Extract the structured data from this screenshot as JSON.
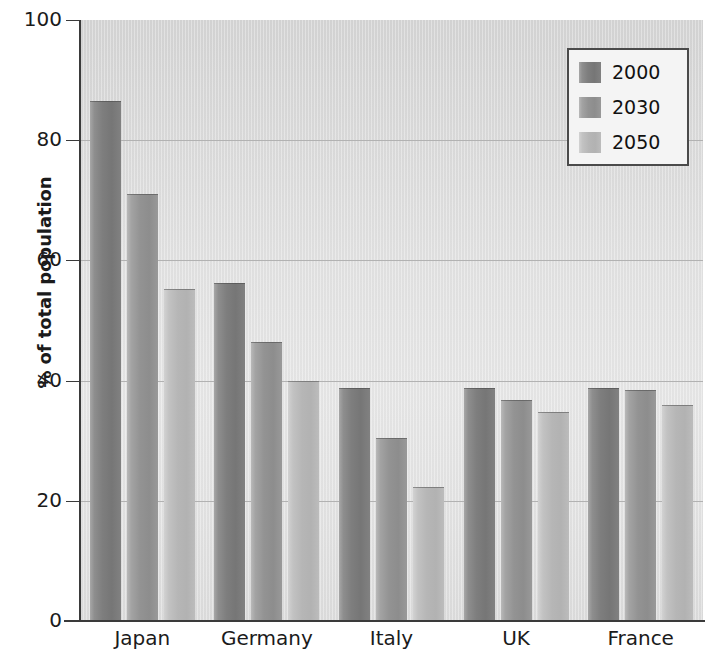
{
  "chart_data": {
    "type": "bar",
    "title": "",
    "xlabel": "",
    "ylabel": "% of total population",
    "ylim": [
      0,
      100
    ],
    "yticks": [
      0,
      20,
      40,
      60,
      80,
      100
    ],
    "grid": "horizontal",
    "legend_position": "top-right",
    "categories": [
      "Japan",
      "Germany",
      "Italy",
      "UK",
      "France"
    ],
    "series": [
      {
        "name": "2000",
        "color": "#7e7e7e",
        "values": [
          86.5,
          56.3,
          38.7,
          38.8,
          38.8
        ]
      },
      {
        "name": "2030",
        "color": "#939393",
        "values": [
          71.0,
          46.5,
          30.5,
          36.8,
          38.5
        ]
      },
      {
        "name": "2050",
        "color": "#b6b6b6",
        "values": [
          55.3,
          40.0,
          22.3,
          34.7,
          36.0
        ]
      }
    ]
  },
  "axis": {
    "y_title": "% of total population",
    "y_tick_labels": [
      "100",
      "80",
      "60",
      "40",
      "20",
      "0"
    ],
    "x_tick_labels": [
      "Japan",
      "Germany",
      "Italy",
      "UK",
      "France"
    ]
  },
  "legend": {
    "entries": [
      {
        "label": "2000"
      },
      {
        "label": "2030"
      },
      {
        "label": "2050"
      }
    ]
  },
  "title_sliver": ""
}
